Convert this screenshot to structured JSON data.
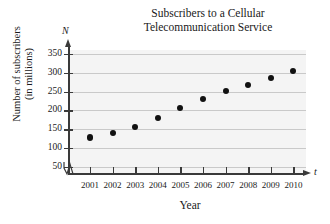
{
  "chart_data": {
    "type": "scatter",
    "title": "Subscribers to a Cellular Telecommunication Service",
    "title_line1": "Subscribers to a Cellular",
    "title_line2": "Telecommunication Service",
    "xlabel": "Year",
    "ylabel": "Number of subscribers (in millions)",
    "ylabel_line1": "Number of subscribers",
    "ylabel_line2": "(in millions)",
    "x_axis_variable": "t",
    "y_axis_variable": "N",
    "categories": [
      "2001",
      "2002",
      "2003",
      "2004",
      "2005",
      "2006",
      "2007",
      "2008",
      "2009",
      "2010"
    ],
    "x": [
      2001,
      2002,
      2003,
      2004,
      2005,
      2006,
      2007,
      2008,
      2009,
      2010
    ],
    "values": [
      128,
      140,
      156,
      179,
      206,
      231,
      252,
      268,
      287,
      305
    ],
    "yticks": [
      350,
      300,
      250,
      200,
      150,
      100,
      50
    ],
    "ytick_labels": [
      "350",
      "300",
      "250",
      "200",
      "150",
      "100",
      "50"
    ],
    "ylim": [
      0,
      375
    ],
    "xlim": [
      2000.4,
      2010.6
    ],
    "grid": true,
    "legend": false,
    "axis_break": true,
    "marker": "filled-circle",
    "marker_color": "#111111",
    "grid_color": "#c9c9c9",
    "panel_color": "#f4f4f4"
  }
}
